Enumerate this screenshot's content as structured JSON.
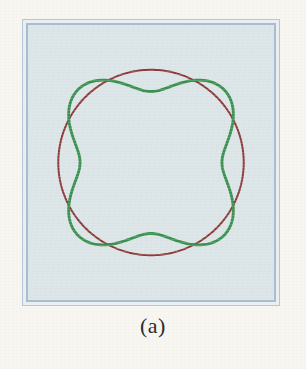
{
  "figure": {
    "caption": "(a)",
    "page_background": "#f8f6f1",
    "panel": {
      "fill": "#dbe4e6",
      "outer_border_color": "#b7c6d6",
      "inner_border_color": "#a9bdd2",
      "gap_fill": "#e9eef0",
      "x": 22,
      "y": 19,
      "width": 258,
      "height": 287
    },
    "curves": [
      {
        "name": "circle",
        "color": "#8c3a3a",
        "stroke_width": 2.1,
        "type": "circle",
        "center_x": 0,
        "center_y": 0,
        "radius": 98
      },
      {
        "name": "four-lobed-rose",
        "color": "#3a9150",
        "stroke_width": 3.0,
        "type": "polar",
        "formula": "r = a + b*cos(4*theta)",
        "a": 92,
        "b": 17,
        "phase_deg": 45
      }
    ]
  },
  "chart_data": {
    "type": "line",
    "title": "(a)",
    "xlabel": "",
    "ylabel": "",
    "grid": false,
    "legend": "none",
    "xlim": [
      -130,
      130
    ],
    "ylim": [
      -130,
      130
    ],
    "series": [
      {
        "name": "circle",
        "color": "#8c3a3a",
        "polar": true,
        "theta_deg": [
          0,
          15,
          30,
          45,
          60,
          75,
          90,
          105,
          120,
          135,
          150,
          165,
          180,
          195,
          210,
          225,
          240,
          255,
          270,
          285,
          300,
          315,
          330,
          345,
          360
        ],
        "r": [
          98,
          98,
          98,
          98,
          98,
          98,
          98,
          98,
          98,
          98,
          98,
          98,
          98,
          98,
          98,
          98,
          98,
          98,
          98,
          98,
          98,
          98,
          98,
          98,
          98
        ]
      },
      {
        "name": "four-lobed rose",
        "color": "#3a9150",
        "polar": true,
        "theta_deg": [
          0,
          15,
          30,
          45,
          60,
          75,
          90,
          105,
          120,
          135,
          150,
          165,
          180,
          195,
          210,
          225,
          240,
          255,
          270,
          285,
          300,
          315,
          330,
          345,
          360
        ],
        "r": [
          75,
          83.5,
          100.5,
          109,
          100.5,
          83.5,
          75,
          83.5,
          100.5,
          109,
          100.5,
          83.5,
          75,
          83.5,
          100.5,
          109,
          100.5,
          83.5,
          75,
          83.5,
          100.5,
          109,
          100.5,
          83.5,
          75
        ]
      }
    ],
    "annotations": [
      {
        "text": "(a)",
        "position": "below-axes"
      }
    ]
  }
}
